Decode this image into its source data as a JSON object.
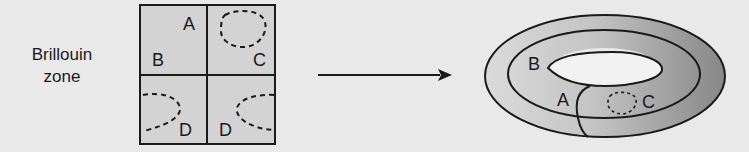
{
  "caption": {
    "line1": "Brillouin",
    "line2": "zone"
  },
  "grid": {
    "cells": [
      {
        "position": "top-left",
        "labels": [
          "A",
          "B"
        ]
      },
      {
        "position": "top-right",
        "labels": [
          "C"
        ],
        "dashed_loop": "closed"
      },
      {
        "position": "bottom-left",
        "labels": [
          "D"
        ],
        "dashed_loop": "open-left"
      },
      {
        "position": "bottom-right",
        "labels": [
          "D"
        ],
        "dashed_loop": "open-right"
      }
    ],
    "label_A": "A",
    "label_B": "B",
    "label_C": "C",
    "label_D1": "D",
    "label_D2": "D",
    "fill": "#d3d3d3",
    "stroke": "#1a1a1a"
  },
  "arrow": {
    "direction": "right",
    "color": "#1a1a1a"
  },
  "torus": {
    "label_A": "A",
    "label_B": "B",
    "label_C": "C",
    "fill_light": "#d6d6d6",
    "fill_dark": "#8c8c8c",
    "hole_fill": "#f2f2f2"
  },
  "colors": {
    "background": "#e9e9e9",
    "ink": "#1a1a1a"
  }
}
